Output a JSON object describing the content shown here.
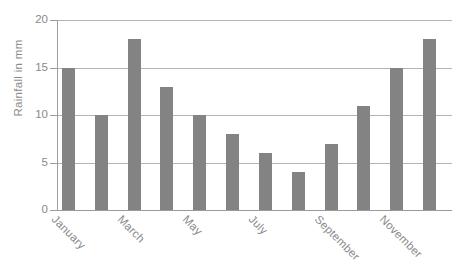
{
  "chart_data": {
    "type": "bar",
    "title": "",
    "subtitle": "",
    "xlabel": "",
    "ylabel": "Rainfall in mm",
    "categories": [
      "January",
      "February",
      "March",
      "April",
      "May",
      "June",
      "July",
      "August",
      "September",
      "October",
      "November",
      "December"
    ],
    "values": [
      15,
      10,
      18,
      13,
      10,
      8,
      6,
      4,
      7,
      11,
      15,
      18
    ],
    "visible_tick_labels": [
      "January",
      "March",
      "May",
      "July",
      "September",
      "November"
    ],
    "visible_tick_indices": [
      0,
      2,
      4,
      6,
      8,
      10
    ],
    "ylim": [
      0,
      20
    ],
    "y_ticks": [
      0,
      5,
      10,
      15,
      20
    ],
    "y_tick_labels": [
      "0",
      "5",
      "10",
      "15",
      "20"
    ],
    "grid": true,
    "grid_axis": "y",
    "legend": false,
    "legend_position": "none",
    "bar_color": "#838383",
    "grid_color": "#b3b3b3",
    "axis_color": "#9e9e9e",
    "text_color": "#8a8a8a",
    "background_color": "#ffffff",
    "x_label_rotation_degrees": 45
  }
}
